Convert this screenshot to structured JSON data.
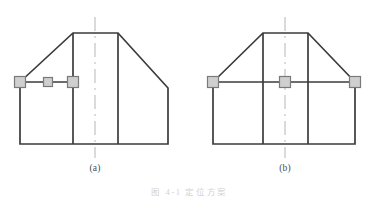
{
  "document": {
    "type": "engineering-drawing",
    "background_color": "#ffffff",
    "width": 379,
    "height": 197
  },
  "style": {
    "outline_color": "#3b3b3b",
    "outline_width": 1.7,
    "inner_line_color": "#3b3b3b",
    "inner_line_width": 1.7,
    "centerline_color": "#bdbdbd",
    "centerline_width": 1.1,
    "centerline_dash": "14 5 2 5",
    "marker_fill": "#cfcfcf",
    "marker_stroke": "#7a7a7a",
    "marker_stroke_width": 1.2,
    "label_color": "#4a4a4a",
    "caption_color": "#d2d2d2"
  },
  "figures": [
    {
      "id": "figure-a",
      "label": "(a)",
      "label_x": 95,
      "label_y": 168,
      "description": "asymmetric chamfered block with three square datum markers along left horizontal ledge",
      "outline_points": "73,33 118,33 168,88 168,144 20,144 20,82",
      "inner_verticals": [
        {
          "x": 73,
          "y1": 33,
          "y2": 144
        },
        {
          "x": 118,
          "y1": 33,
          "y2": 144
        }
      ],
      "ledge_line": {
        "x1": 20,
        "y1": 82,
        "x2": 73,
        "y2": 82
      },
      "centerline": {
        "x": 95,
        "y1": 17,
        "y2": 158
      },
      "markers": [
        {
          "name": "marker-left",
          "cx": 20,
          "cy": 82,
          "size": 11
        },
        {
          "name": "marker-middle",
          "cx": 48,
          "cy": 82,
          "size": 9
        },
        {
          "name": "marker-right",
          "cx": 73,
          "cy": 82,
          "size": 11
        }
      ]
    },
    {
      "id": "figure-b",
      "label": "(b)",
      "label_x": 285,
      "label_y": 168,
      "description": "symmetric trapezoidal block with three square datum markers along full-width horizontal ledge",
      "outline_points": "263,33 308,33 355,82 355,144 213,144 213,82",
      "inner_verticals": [
        {
          "x": 263,
          "y1": 33,
          "y2": 144
        },
        {
          "x": 308,
          "y1": 33,
          "y2": 144
        }
      ],
      "ledge_line": {
        "x1": 213,
        "y1": 82,
        "x2": 355,
        "y2": 82
      },
      "centerline": {
        "x": 285,
        "y1": 17,
        "y2": 158
      },
      "markers": [
        {
          "name": "marker-left",
          "cx": 213,
          "cy": 82,
          "size": 11
        },
        {
          "name": "marker-middle",
          "cx": 285,
          "cy": 82,
          "size": 11
        },
        {
          "name": "marker-right",
          "cx": 355,
          "cy": 82,
          "size": 11
        }
      ]
    }
  ],
  "caption": {
    "text": "图 4-1  定位方案",
    "visible_fragment": "图 4-1 定位方案"
  }
}
